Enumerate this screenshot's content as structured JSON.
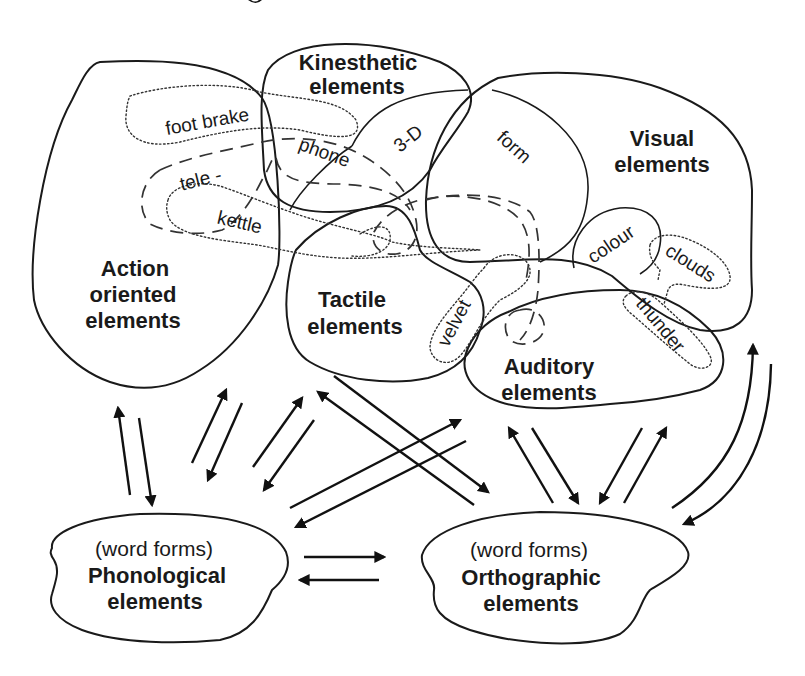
{
  "diagram": {
    "title_fragment": "g",
    "regions": {
      "action": {
        "line1": "Action",
        "line2": "oriented",
        "line3": "elements"
      },
      "kinesthetic": {
        "line1": "Kinesthetic",
        "line2": "elements"
      },
      "visual": {
        "line1": "Visual",
        "line2": "elements"
      },
      "tactile": {
        "line1": "Tactile",
        "line2": "elements"
      },
      "auditory": {
        "line1": "Auditory",
        "line2": "elements"
      },
      "phonological": {
        "qualifier": "(word forms)",
        "line1": "Phonological",
        "line2": "elements"
      },
      "orthographic": {
        "qualifier": "(word forms)",
        "line1": "Orthographic",
        "line2": "elements"
      }
    },
    "concepts": {
      "foot_brake": "foot brake",
      "tele": "tele -",
      "kettle": "kettle",
      "phone": "phone",
      "three_d": "3-D",
      "form": "form",
      "velvet": "velvet",
      "colour": "colour",
      "clouds": "clouds",
      "thunder": "thunder"
    },
    "connections": [
      {
        "between": [
          "Action oriented elements",
          "Phonological elements"
        ],
        "direction": "bidirectional"
      },
      {
        "between": [
          "Kinesthetic elements",
          "Phonological elements"
        ],
        "direction": "bidirectional"
      },
      {
        "between": [
          "Tactile elements",
          "Phonological elements"
        ],
        "direction": "bidirectional"
      },
      {
        "between": [
          "Tactile elements",
          "Orthographic elements"
        ],
        "direction": "bidirectional"
      },
      {
        "between": [
          "Auditory elements",
          "Phonological elements"
        ],
        "direction": "bidirectional"
      },
      {
        "between": [
          "Auditory elements",
          "Orthographic elements"
        ],
        "direction": "bidirectional"
      },
      {
        "between": [
          "Visual elements",
          "Orthographic elements"
        ],
        "direction": "bidirectional"
      },
      {
        "between": [
          "Phonological elements",
          "Orthographic elements"
        ],
        "direction": "bidirectional"
      }
    ],
    "line_styles": {
      "solid": "modality region",
      "dotted": "concept representation",
      "dashed": "compound word representation (telephone)"
    }
  }
}
